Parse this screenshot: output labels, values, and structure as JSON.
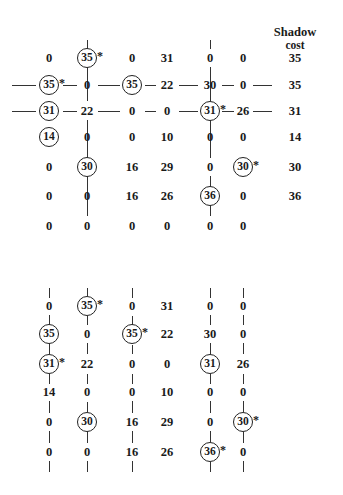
{
  "header": {
    "shadow_cost_line1": "Shadow",
    "shadow_cost_line2": "cost",
    "shadow_cost_x": 295,
    "shadow_cost_y": 26
  },
  "layout": {
    "cols": [
      49,
      87,
      132,
      167,
      210,
      243
    ],
    "shadow_col_x": 295,
    "top_rows": [
      58,
      85,
      111,
      137,
      167,
      196,
      226
    ],
    "bottom_rows": [
      306,
      334,
      364,
      392,
      422,
      452
    ],
    "cell_half_w": 17,
    "cell_half_h": 11
  },
  "grids": [
    {
      "name": "top-grid",
      "has_shadow_cost": true,
      "rows": [
        {
          "cells": [
            {
              "v": "0",
              "circled": false,
              "star": false
            },
            {
              "v": "35",
              "circled": true,
              "star": true
            },
            {
              "v": "0",
              "circled": false,
              "star": false
            },
            {
              "v": "31",
              "circled": false,
              "star": false
            },
            {
              "v": "0",
              "circled": false,
              "star": false
            },
            {
              "v": "0",
              "circled": false,
              "star": false
            }
          ],
          "shadow": "35"
        },
        {
          "cells": [
            {
              "v": "35",
              "circled": true,
              "star": true
            },
            {
              "v": "0",
              "circled": false,
              "star": false
            },
            {
              "v": "35",
              "circled": true,
              "star": false
            },
            {
              "v": "22",
              "circled": false,
              "star": false
            },
            {
              "v": "30",
              "circled": false,
              "star": false
            },
            {
              "v": "0",
              "circled": false,
              "star": false
            }
          ],
          "shadow": "35"
        },
        {
          "cells": [
            {
              "v": "31",
              "circled": true,
              "star": false
            },
            {
              "v": "22",
              "circled": false,
              "star": false
            },
            {
              "v": "0",
              "circled": false,
              "star": false
            },
            {
              "v": "0",
              "circled": false,
              "star": false
            },
            {
              "v": "31",
              "circled": true,
              "star": true
            },
            {
              "v": "26",
              "circled": false,
              "star": false
            }
          ],
          "shadow": "31"
        },
        {
          "cells": [
            {
              "v": "14",
              "circled": true,
              "star": false
            },
            {
              "v": "0",
              "circled": false,
              "star": false
            },
            {
              "v": "0",
              "circled": false,
              "star": false
            },
            {
              "v": "10",
              "circled": false,
              "star": false
            },
            {
              "v": "0",
              "circled": false,
              "star": false
            },
            {
              "v": "0",
              "circled": false,
              "star": false
            }
          ],
          "shadow": "14"
        },
        {
          "cells": [
            {
              "v": "0",
              "circled": false,
              "star": false
            },
            {
              "v": "30",
              "circled": true,
              "star": false
            },
            {
              "v": "16",
              "circled": false,
              "star": false
            },
            {
              "v": "29",
              "circled": false,
              "star": false
            },
            {
              "v": "0",
              "circled": false,
              "star": false
            },
            {
              "v": "30",
              "circled": true,
              "star": true
            }
          ],
          "shadow": "30"
        },
        {
          "cells": [
            {
              "v": "0",
              "circled": false,
              "star": false
            },
            {
              "v": "0",
              "circled": false,
              "star": false
            },
            {
              "v": "16",
              "circled": false,
              "star": false
            },
            {
              "v": "26",
              "circled": false,
              "star": false
            },
            {
              "v": "36",
              "circled": true,
              "star": false
            },
            {
              "v": "0",
              "circled": false,
              "star": false
            }
          ],
          "shadow": "36"
        },
        {
          "cells": [
            {
              "v": "0",
              "circled": false,
              "star": false
            },
            {
              "v": "0",
              "circled": false,
              "star": false
            },
            {
              "v": "0",
              "circled": false,
              "star": false
            },
            {
              "v": "0",
              "circled": false,
              "star": false
            },
            {
              "v": "0",
              "circled": false,
              "star": false
            },
            {
              "v": "0",
              "circled": false,
              "star": false
            }
          ],
          "shadow": ""
        }
      ],
      "vlines": [
        {
          "col": 1,
          "y1": 40,
          "y2": 49
        },
        {
          "col": 1,
          "y1": 67,
          "y2": 101
        },
        {
          "col": 1,
          "y1": 120,
          "y2": 158
        },
        {
          "col": 1,
          "y1": 176,
          "y2": 216
        },
        {
          "col": 4,
          "y1": 40,
          "y2": 49
        },
        {
          "col": 4,
          "y1": 67,
          "y2": 101
        },
        {
          "col": 4,
          "y1": 120,
          "y2": 158
        },
        {
          "col": 4,
          "y1": 176,
          "y2": 188
        },
        {
          "col": 4,
          "y1": 205,
          "y2": 216
        }
      ],
      "hlines": [
        {
          "row": 1,
          "x1": 12,
          "x2": 36
        },
        {
          "row": 1,
          "x1": 63,
          "x2": 77
        },
        {
          "row": 1,
          "x1": 98,
          "x2": 120
        },
        {
          "row": 1,
          "x1": 145,
          "x2": 156
        },
        {
          "row": 1,
          "x1": 179,
          "x2": 198
        },
        {
          "row": 1,
          "x1": 222,
          "x2": 234
        },
        {
          "row": 1,
          "x1": 253,
          "x2": 272
        },
        {
          "row": 2,
          "x1": 12,
          "x2": 36
        },
        {
          "row": 2,
          "x1": 63,
          "x2": 77
        },
        {
          "row": 2,
          "x1": 98,
          "x2": 120
        },
        {
          "row": 2,
          "x1": 145,
          "x2": 156
        },
        {
          "row": 2,
          "x1": 179,
          "x2": 198
        },
        {
          "row": 2,
          "x1": 222,
          "x2": 234
        },
        {
          "row": 2,
          "x1": 253,
          "x2": 272
        }
      ]
    },
    {
      "name": "bottom-grid",
      "has_shadow_cost": false,
      "rows": [
        {
          "cells": [
            {
              "v": "0",
              "circled": false,
              "star": false
            },
            {
              "v": "35",
              "circled": true,
              "star": true
            },
            {
              "v": "0",
              "circled": false,
              "star": false
            },
            {
              "v": "31",
              "circled": false,
              "star": false
            },
            {
              "v": "0",
              "circled": false,
              "star": false
            },
            {
              "v": "0",
              "circled": false,
              "star": false
            }
          ]
        },
        {
          "cells": [
            {
              "v": "35",
              "circled": true,
              "star": false
            },
            {
              "v": "0",
              "circled": false,
              "star": false
            },
            {
              "v": "35",
              "circled": true,
              "star": true
            },
            {
              "v": "22",
              "circled": false,
              "star": false
            },
            {
              "v": "30",
              "circled": false,
              "star": false
            },
            {
              "v": "0",
              "circled": false,
              "star": false
            }
          ]
        },
        {
          "cells": [
            {
              "v": "31",
              "circled": true,
              "star": true
            },
            {
              "v": "22",
              "circled": false,
              "star": false
            },
            {
              "v": "0",
              "circled": false,
              "star": false
            },
            {
              "v": "0",
              "circled": false,
              "star": false
            },
            {
              "v": "31",
              "circled": true,
              "star": false
            },
            {
              "v": "26",
              "circled": false,
              "star": false
            }
          ]
        },
        {
          "cells": [
            {
              "v": "14",
              "circled": false,
              "star": false
            },
            {
              "v": "0",
              "circled": false,
              "star": false
            },
            {
              "v": "0",
              "circled": false,
              "star": false
            },
            {
              "v": "10",
              "circled": false,
              "star": false
            },
            {
              "v": "0",
              "circled": false,
              "star": false
            },
            {
              "v": "0",
              "circled": false,
              "star": false
            }
          ]
        },
        {
          "cells": [
            {
              "v": "0",
              "circled": false,
              "star": false
            },
            {
              "v": "30",
              "circled": true,
              "star": false
            },
            {
              "v": "16",
              "circled": false,
              "star": false
            },
            {
              "v": "29",
              "circled": false,
              "star": false
            },
            {
              "v": "0",
              "circled": false,
              "star": false
            },
            {
              "v": "30",
              "circled": true,
              "star": true
            }
          ]
        },
        {
          "cells": [
            {
              "v": "0",
              "circled": false,
              "star": false
            },
            {
              "v": "0",
              "circled": false,
              "star": false
            },
            {
              "v": "16",
              "circled": false,
              "star": false
            },
            {
              "v": "26",
              "circled": false,
              "star": false
            },
            {
              "v": "36",
              "circled": true,
              "star": true
            },
            {
              "v": "0",
              "circled": false,
              "star": false
            }
          ]
        }
      ],
      "vlines": [
        {
          "col": 0,
          "y1": 288,
          "y2": 298
        },
        {
          "col": 0,
          "y1": 315,
          "y2": 325
        },
        {
          "col": 0,
          "y1": 343,
          "y2": 354
        },
        {
          "col": 0,
          "y1": 374,
          "y2": 384
        },
        {
          "col": 0,
          "y1": 401,
          "y2": 413
        },
        {
          "col": 0,
          "y1": 431,
          "y2": 443
        },
        {
          "col": 0,
          "y1": 461,
          "y2": 472
        },
        {
          "col": 1,
          "y1": 288,
          "y2": 296
        },
        {
          "col": 1,
          "y1": 316,
          "y2": 325
        },
        {
          "col": 1,
          "y1": 343,
          "y2": 354
        },
        {
          "col": 1,
          "y1": 374,
          "y2": 384
        },
        {
          "col": 1,
          "y1": 402,
          "y2": 412
        },
        {
          "col": 1,
          "y1": 431,
          "y2": 443
        },
        {
          "col": 1,
          "y1": 461,
          "y2": 472
        },
        {
          "col": 2,
          "y1": 288,
          "y2": 298
        },
        {
          "col": 2,
          "y1": 316,
          "y2": 325
        },
        {
          "col": 2,
          "y1": 345,
          "y2": 354
        },
        {
          "col": 2,
          "y1": 374,
          "y2": 384
        },
        {
          "col": 2,
          "y1": 401,
          "y2": 413
        },
        {
          "col": 2,
          "y1": 431,
          "y2": 443
        },
        {
          "col": 2,
          "y1": 461,
          "y2": 472
        },
        {
          "col": 4,
          "y1": 288,
          "y2": 298
        },
        {
          "col": 4,
          "y1": 315,
          "y2": 325
        },
        {
          "col": 4,
          "y1": 343,
          "y2": 354
        },
        {
          "col": 4,
          "y1": 374,
          "y2": 384
        },
        {
          "col": 4,
          "y1": 401,
          "y2": 413
        },
        {
          "col": 4,
          "y1": 431,
          "y2": 442
        },
        {
          "col": 4,
          "y1": 462,
          "y2": 472
        },
        {
          "col": 5,
          "y1": 288,
          "y2": 298
        },
        {
          "col": 5,
          "y1": 315,
          "y2": 325
        },
        {
          "col": 5,
          "y1": 343,
          "y2": 354
        },
        {
          "col": 5,
          "y1": 374,
          "y2": 384
        },
        {
          "col": 5,
          "y1": 401,
          "y2": 412
        },
        {
          "col": 5,
          "y1": 432,
          "y2": 443
        },
        {
          "col": 5,
          "y1": 461,
          "y2": 472
        }
      ],
      "hlines": []
    }
  ]
}
